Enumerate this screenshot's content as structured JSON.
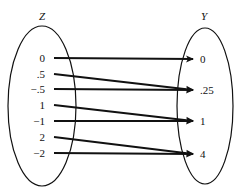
{
  "diagram": {
    "domain_set": {
      "label": "Z",
      "elements": [
        "0",
        ".5",
        "−.5",
        "1",
        "−1",
        "2",
        "−2"
      ]
    },
    "codomain_set": {
      "label": "Y",
      "elements": [
        "0",
        ".25",
        "1",
        "4"
      ]
    },
    "mappings": [
      {
        "from": "0",
        "to": "0"
      },
      {
        "from": ".5",
        "to": ".25"
      },
      {
        "from": "−.5",
        "to": ".25"
      },
      {
        "from": "1",
        "to": "1"
      },
      {
        "from": "−1",
        "to": "1"
      },
      {
        "from": "2",
        "to": "4"
      },
      {
        "from": "−2",
        "to": "4"
      }
    ],
    "colors": {
      "stroke": "#111111",
      "background": "#ffffff"
    }
  }
}
